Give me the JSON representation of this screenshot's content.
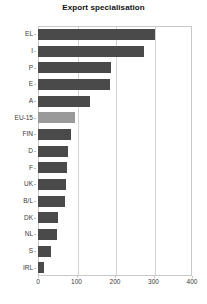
{
  "chart_data": {
    "type": "bar",
    "orientation": "horizontal",
    "title": "Export specialisation",
    "xlabel": "",
    "ylabel": "",
    "categories": [
      "EL",
      "I",
      "P",
      "E",
      "A",
      "EU-15",
      "FIN",
      "D",
      "F",
      "UK",
      "B/L",
      "DK",
      "NL",
      "S",
      "IRL"
    ],
    "values": [
      304,
      275,
      190,
      187,
      135,
      96,
      86,
      78,
      75,
      73,
      70,
      52,
      49,
      34,
      15
    ],
    "xlim": [
      0,
      400
    ],
    "xticks": [
      0,
      100,
      200,
      300,
      400
    ],
    "xtick_labels": [
      "0",
      "100",
      "200",
      "300",
      "400"
    ],
    "grid": "vertical",
    "legend": "none",
    "highlight_category": "EU-15",
    "bar_color": "#4a4a4a",
    "highlight_color": "#9a9a9a",
    "grid_color": "#d4d4d4",
    "axis_color": "#c8c8c8",
    "background": "#ffffff"
  }
}
